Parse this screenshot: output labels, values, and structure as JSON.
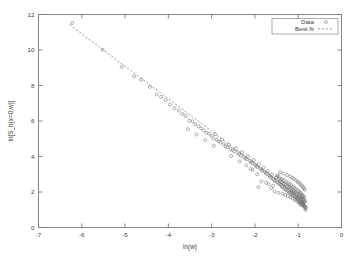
{
  "chart_data": {
    "type": "scatter",
    "title": "",
    "xlabel": "ln(w)",
    "ylabel": "ln[S_h(x=0,w)]",
    "xlim": [
      -7,
      0
    ],
    "ylim": [
      0,
      12
    ],
    "xticks": [
      "-7",
      "-6",
      "-5",
      "-4",
      "-3",
      "-2",
      "-1",
      "0"
    ],
    "xtick_values": [
      -7,
      -6,
      -5,
      -4,
      -3,
      -2,
      -1,
      0
    ],
    "yticks": [
      "0",
      "2",
      "4",
      "6",
      "8",
      "10",
      "12"
    ],
    "ytick_values": [
      0,
      2,
      4,
      6,
      8,
      10,
      12
    ],
    "grid": false,
    "legend_position": "top-right",
    "series": [
      {
        "name": "Data",
        "type": "scatter",
        "marker": "open-circle",
        "color": "#6f6f6f",
        "points": [
          [
            -6.22,
            11.52
          ],
          [
            -5.52,
            10.02
          ],
          [
            -5.08,
            9.05
          ],
          [
            -4.79,
            8.52
          ],
          [
            -4.63,
            8.32
          ],
          [
            -4.43,
            7.92
          ],
          [
            -4.27,
            7.5
          ],
          [
            -4.17,
            7.36
          ],
          [
            -4.06,
            7.18
          ],
          [
            -3.96,
            6.92
          ],
          [
            -3.86,
            6.72
          ],
          [
            -3.76,
            6.58
          ],
          [
            -3.68,
            6.4
          ],
          [
            -3.6,
            6.28
          ],
          [
            -3.52,
            6.02
          ],
          [
            -3.44,
            5.98
          ],
          [
            -3.38,
            5.82
          ],
          [
            -3.3,
            5.7
          ],
          [
            -3.24,
            5.58
          ],
          [
            -3.18,
            5.46
          ],
          [
            -3.12,
            5.34
          ],
          [
            -3.06,
            5.28
          ],
          [
            -3.0,
            5.16
          ],
          [
            -2.96,
            5.02
          ],
          [
            -2.92,
            5.26
          ],
          [
            -2.88,
            4.94
          ],
          [
            -2.84,
            4.86
          ],
          [
            -2.8,
            4.78
          ],
          [
            -2.76,
            4.96
          ],
          [
            -2.72,
            4.7
          ],
          [
            -2.68,
            4.58
          ],
          [
            -2.64,
            4.52
          ],
          [
            -2.6,
            4.66
          ],
          [
            -2.56,
            4.44
          ],
          [
            -2.52,
            4.36
          ],
          [
            -2.48,
            4.28
          ],
          [
            -2.44,
            4.46
          ],
          [
            -2.4,
            4.22
          ],
          [
            -2.36,
            4.14
          ],
          [
            -2.33,
            4.06
          ],
          [
            -2.3,
            4.24
          ],
          [
            -2.26,
            3.98
          ],
          [
            -2.22,
            3.9
          ],
          [
            -2.19,
            3.84
          ],
          [
            -2.16,
            4.02
          ],
          [
            -2.12,
            3.76
          ],
          [
            -2.09,
            3.68
          ],
          [
            -2.06,
            3.62
          ],
          [
            -2.03,
            3.8
          ],
          [
            -2.0,
            3.54
          ],
          [
            -1.97,
            3.46
          ],
          [
            -1.94,
            3.4
          ],
          [
            -1.91,
            3.58
          ],
          [
            -1.88,
            3.34
          ],
          [
            -1.85,
            3.26
          ],
          [
            -1.83,
            3.2
          ],
          [
            -1.8,
            3.38
          ],
          [
            -1.77,
            3.14
          ],
          [
            -1.75,
            3.06
          ],
          [
            -1.72,
            3.0
          ],
          [
            -1.7,
            3.18
          ],
          [
            -1.67,
            2.94
          ],
          [
            -1.65,
            2.86
          ],
          [
            -1.62,
            2.8
          ],
          [
            -1.6,
            2.98
          ],
          [
            -1.58,
            2.74
          ],
          [
            -1.55,
            2.66
          ],
          [
            -1.53,
            2.62
          ],
          [
            -1.51,
            2.8
          ],
          [
            -1.49,
            2.56
          ],
          [
            -1.46,
            2.5
          ],
          [
            -1.44,
            2.44
          ],
          [
            -1.42,
            2.62
          ],
          [
            -1.4,
            2.4
          ],
          [
            -1.38,
            2.32
          ],
          [
            -1.36,
            2.28
          ],
          [
            -1.34,
            2.46
          ],
          [
            -1.32,
            2.22
          ],
          [
            -1.3,
            2.16
          ],
          [
            -1.28,
            2.12
          ],
          [
            -1.26,
            2.3
          ],
          [
            -1.24,
            2.06
          ],
          [
            -1.22,
            2.0
          ],
          [
            -1.2,
            1.96
          ],
          [
            -1.18,
            2.14
          ],
          [
            -1.17,
            1.92
          ],
          [
            -1.15,
            1.86
          ],
          [
            -1.13,
            1.82
          ],
          [
            -1.11,
            2.0
          ],
          [
            -1.09,
            1.78
          ],
          [
            -1.08,
            1.72
          ],
          [
            -1.06,
            1.68
          ],
          [
            -1.04,
            1.86
          ],
          [
            -1.03,
            1.64
          ],
          [
            -1.01,
            1.58
          ],
          [
            -0.99,
            1.54
          ],
          [
            -0.98,
            1.72
          ],
          [
            -0.96,
            1.5
          ],
          [
            -0.95,
            1.44
          ],
          [
            -0.93,
            1.4
          ],
          [
            -0.92,
            1.58
          ],
          [
            -0.9,
            1.36
          ],
          [
            -0.89,
            1.3
          ],
          [
            -0.87,
            1.26
          ],
          [
            -0.86,
            1.44
          ],
          [
            -0.85,
            1.22
          ],
          [
            -0.84,
            1.16
          ],
          [
            -0.82,
            1.12
          ],
          [
            -2.1,
            3.3
          ],
          [
            -1.95,
            3.0
          ],
          [
            -1.85,
            2.6
          ],
          [
            -1.74,
            2.52
          ],
          [
            -1.68,
            2.44
          ],
          [
            -1.58,
            2.36
          ],
          [
            -1.48,
            2.94
          ],
          [
            -1.45,
            2.88
          ],
          [
            -1.38,
            2.72
          ],
          [
            -1.33,
            2.66
          ],
          [
            -1.28,
            2.58
          ],
          [
            -1.23,
            2.52
          ],
          [
            -1.2,
            2.44
          ],
          [
            -1.16,
            2.38
          ],
          [
            -1.12,
            2.3
          ],
          [
            -1.09,
            2.24
          ],
          [
            -1.06,
            2.18
          ],
          [
            -1.02,
            2.1
          ],
          [
            -0.99,
            2.04
          ],
          [
            -0.96,
            1.98
          ],
          [
            -0.94,
            1.92
          ],
          [
            -0.91,
            1.84
          ],
          [
            -0.88,
            1.78
          ],
          [
            -0.86,
            1.7
          ],
          [
            -1.55,
            2.02
          ],
          [
            -1.46,
            1.96
          ],
          [
            -1.36,
            1.9
          ],
          [
            -1.3,
            1.82
          ],
          [
            -1.24,
            1.76
          ],
          [
            -1.18,
            1.7
          ],
          [
            -1.13,
            1.64
          ],
          [
            -1.08,
            1.56
          ],
          [
            -1.04,
            1.5
          ],
          [
            -1.0,
            1.44
          ],
          [
            -0.97,
            1.38
          ],
          [
            -0.93,
            1.32
          ],
          [
            -0.9,
            1.24
          ],
          [
            -0.87,
            1.18
          ],
          [
            -0.84,
            1.08
          ],
          [
            -0.83,
            0.98
          ],
          [
            -1.92,
            2.28
          ],
          [
            -1.62,
            2.22
          ],
          [
            -1.42,
            3.12
          ],
          [
            -1.35,
            3.04
          ],
          [
            -1.26,
            2.96
          ],
          [
            -1.19,
            2.88
          ],
          [
            -1.14,
            2.8
          ],
          [
            -1.1,
            2.74
          ],
          [
            -1.05,
            2.66
          ],
          [
            -1.02,
            2.58
          ],
          [
            -0.98,
            2.52
          ],
          [
            -0.95,
            2.44
          ],
          [
            -0.92,
            2.36
          ],
          [
            -0.89,
            2.28
          ],
          [
            -0.87,
            2.2
          ],
          [
            -0.85,
            2.12
          ],
          [
            -2.55,
            4.02
          ],
          [
            -2.35,
            3.72
          ],
          [
            -2.2,
            3.5
          ],
          [
            -2.05,
            3.24
          ],
          [
            -3.55,
            5.54
          ],
          [
            -3.35,
            5.24
          ],
          [
            -3.15,
            4.92
          ],
          [
            -2.95,
            4.6
          ],
          [
            -0.94,
            1.62
          ],
          [
            -0.92,
            1.68
          ],
          [
            -0.9,
            1.74
          ],
          [
            -0.88,
            1.6
          ],
          [
            -0.86,
            1.54
          ],
          [
            -0.84,
            1.48
          ],
          [
            -0.96,
            1.8
          ],
          [
            -0.98,
            1.88
          ],
          [
            -1.0,
            1.66
          ],
          [
            -1.02,
            1.76
          ],
          [
            -1.05,
            1.9
          ],
          [
            -1.07,
            1.98
          ],
          [
            -1.1,
            2.06
          ],
          [
            -1.12,
            1.94
          ],
          [
            -1.15,
            2.08
          ],
          [
            -1.17,
            2.22
          ],
          [
            -1.21,
            2.26
          ],
          [
            -1.25,
            2.34
          ],
          [
            -1.29,
            2.4
          ],
          [
            -1.33,
            2.48
          ],
          [
            -1.37,
            2.54
          ],
          [
            -1.41,
            2.68
          ],
          [
            -1.44,
            2.76
          ],
          [
            -1.5,
            2.84
          ],
          [
            -0.88,
            1.34
          ],
          [
            -0.91,
            1.42
          ],
          [
            -0.93,
            1.48
          ],
          [
            -0.95,
            1.28
          ]
        ]
      },
      {
        "name": "Best fit",
        "type": "line",
        "style": "dashed",
        "color": "#8a8a8a",
        "slope": -1.83,
        "intercept": -0.07,
        "endpoints": [
          [
            -6.28,
            11.43
          ],
          [
            -0.8,
            1.4
          ]
        ]
      }
    ],
    "legend": [
      {
        "label": "Data",
        "marker": "open-circle"
      },
      {
        "label": "Best fit",
        "marker": "dashed-line"
      }
    ]
  }
}
